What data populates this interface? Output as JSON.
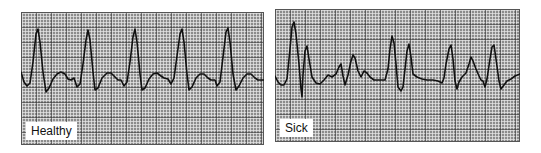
{
  "panels": [
    {
      "id": "healthy",
      "label": "Healthy",
      "box": {
        "x": 21,
        "y": 12,
        "w": 243,
        "h": 133
      },
      "trace": "M0,60 L3,70 L6,74 L9,71 L12,50 L15,22 L17,17 L19,30 L22,60 L25,80 L28,76 L32,67 L36,62 L40,60 L44,62 L47,67 L50,68 L53,66 L56,75 L59,72 L62,52 L65,28 L67,18 L69,28 L72,60 L74,78 L77,76 L81,66 L86,61 L90,61 L94,65 L97,68 L100,68 L103,74 L106,70 L109,50 L112,25 L114,17 L116,30 L119,62 L121,78 L124,76 L128,67 L132,62 L136,61 L140,64 L143,66 L147,67 L150,72 L153,66 L156,44 L159,22 L161,17 L163,30 L166,62 L168,78 L171,75 L175,66 L179,62 L183,62 L187,66 L190,68 L194,68 L196,74 L199,70 L202,45 L205,20 L207,16 L209,30 L212,62 L215,78 L218,74 L222,66 L226,62 L230,62 L234,66 L237,68 L243,68"
    },
    {
      "id": "sick",
      "label": "Sick",
      "box": {
        "x": 275,
        "y": 9,
        "w": 245,
        "h": 133
      },
      "trace": "M0,67 L3,73 L6,76 L9,76 L12,70 L15,40 L17,18 L19,13 L21,25 L24,55 L26,80 L27,88 L28,66 L30,42 L32,37 L34,50 L37,68 L41,74 L45,75 L49,71 L53,66 L57,68 L61,65 L64,58 L66,55 L68,67 L70,76 L73,66 L76,52 L78,46 L80,49 L83,62 L86,68 L89,62 L92,64 L95,68 L99,71 L104,71 L110,71 L113,60 L115,40 L117,27 L119,34 L121,55 L123,78 L126,82 L128,78 L130,60 L132,42 L134,35 L136,48 L138,65 L142,68 L147,70 L152,71 L158,71 L163,72 L167,74 L169,69 L171,55 L174,40 L176,36 L178,50 L180,72 L182,80 L184,73 L187,68 L191,64 L194,55 L196,48 L198,52 L201,60 L204,67 L206,71 L208,72 L210,78 L212,70 L215,50 L217,38 L219,36 L221,50 L224,72 L226,80 L229,76 L232,72 L236,70 L240,67 L245,65"
    }
  ],
  "colors": {
    "grid_background": "#8c8c8c",
    "grid_minor": "#e6e6e6",
    "grid_major": "#3a3a3a",
    "trace": "#111111",
    "label_bg": "#ffffff"
  }
}
